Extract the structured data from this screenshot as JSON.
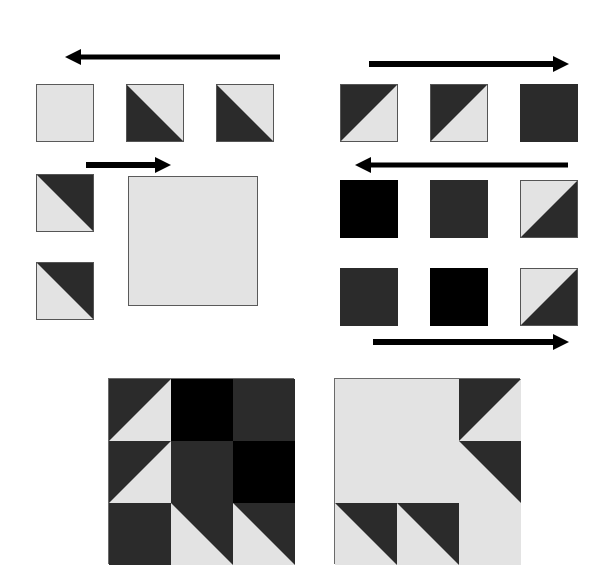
{
  "figure": {
    "kind": "quilt-block-piecing-diagram",
    "colors": {
      "light_fabric": "#e3e3e3",
      "dark_fabric": "#2b2b2b",
      "black_fabric": "#000000",
      "patch_outline": "#555555",
      "arrow": "#000000",
      "background": "#ffffff"
    },
    "canvas": {
      "width": 614,
      "height": 587
    }
  },
  "arrows": [
    {
      "name": "arrow-top-left",
      "direction": "left",
      "x": 65,
      "y": 48,
      "length": 215,
      "thickness": 5
    },
    {
      "name": "arrow-mid-left",
      "direction": "right",
      "x": 86,
      "y": 156,
      "length": 85,
      "thickness": 6
    },
    {
      "name": "arrow-top-right",
      "direction": "right",
      "x": 369,
      "y": 55,
      "length": 200,
      "thickness": 6
    },
    {
      "name": "arrow-mid-right",
      "direction": "left",
      "x": 355,
      "y": 156,
      "length": 213,
      "thickness": 5
    },
    {
      "name": "arrow-bottom-right",
      "direction": "right",
      "x": 373,
      "y": 333,
      "length": 196,
      "thickness": 6
    }
  ],
  "groups": [
    {
      "name": "top-left-row",
      "label": "Top-left unit row, sewn right to left",
      "patches": [
        {
          "name": "patch-tl-1",
          "fill": "solid-light",
          "x": 36,
          "y": 84,
          "size": 58
        },
        {
          "name": "patch-tl-2",
          "fill": "tri-bl",
          "x": 126,
          "y": 84,
          "size": 58
        },
        {
          "name": "patch-tl-3",
          "fill": "tri-bl",
          "x": 216,
          "y": 84,
          "size": 58
        }
      ]
    },
    {
      "name": "middle-left-group",
      "label": "Middle-left unit group, sewn left to right",
      "patches": [
        {
          "name": "patch-ml-1",
          "fill": "tri-tr",
          "x": 36,
          "y": 174,
          "size": 58
        },
        {
          "name": "patch-ml-2",
          "fill": "tri-tr",
          "x": 36,
          "y": 262,
          "size": 58
        }
      ],
      "big_patch": {
        "name": "patch-ml-big",
        "fill": "solid-light",
        "x": 128,
        "y": 176,
        "size": 130
      }
    },
    {
      "name": "top-right-row",
      "label": "Top-right unit row, sewn left to right",
      "patches": [
        {
          "name": "patch-tr-1",
          "fill": "tri-tl",
          "x": 340,
          "y": 84,
          "size": 58
        },
        {
          "name": "patch-tr-2",
          "fill": "tri-tl",
          "x": 430,
          "y": 84,
          "size": 58
        },
        {
          "name": "patch-tr-3",
          "fill": "solid-dark",
          "x": 520,
          "y": 84,
          "size": 58
        }
      ]
    },
    {
      "name": "middle-right-row",
      "label": "Middle-right unit row, sewn right to left",
      "patches": [
        {
          "name": "patch-mr-1",
          "fill": "solid-black",
          "x": 340,
          "y": 180,
          "size": 58
        },
        {
          "name": "patch-mr-2",
          "fill": "solid-dark",
          "x": 430,
          "y": 180,
          "size": 58
        },
        {
          "name": "patch-mr-3",
          "fill": "tri-br",
          "x": 520,
          "y": 180,
          "size": 58
        }
      ]
    },
    {
      "name": "bottom-right-row",
      "label": "Bottom-right unit row, sewn left to right",
      "patches": [
        {
          "name": "patch-br-1",
          "fill": "solid-dark",
          "x": 340,
          "y": 268,
          "size": 58
        },
        {
          "name": "patch-br-2",
          "fill": "solid-black",
          "x": 430,
          "y": 268,
          "size": 58
        },
        {
          "name": "patch-br-3",
          "fill": "tri-br",
          "x": 520,
          "y": 268,
          "size": 58
        }
      ]
    }
  ],
  "blocks": [
    {
      "name": "finished-block-dark",
      "label": "Finished dark quilt block",
      "x": 108,
      "y": 378,
      "size": 186,
      "grid": 3,
      "cells": [
        "c-tri-br",
        "c-black",
        "c-dark",
        "c-tri-br",
        "c-dark",
        "c-black",
        "c-dark",
        "c-tri-tr",
        "c-tri-tr"
      ]
    },
    {
      "name": "finished-block-light",
      "label": "Finished light quilt block",
      "x": 334,
      "y": 378,
      "size": 186,
      "grid": 3,
      "large_cell": {
        "name": "block-light-center-square",
        "col": 0,
        "row": 0,
        "span": 2,
        "fill": "c-light"
      },
      "cells": [
        null,
        null,
        "c-tri-tl",
        null,
        null,
        "c-tri-bl",
        "c-tri-tr",
        "c-tri-tr",
        "c-light"
      ]
    }
  ]
}
